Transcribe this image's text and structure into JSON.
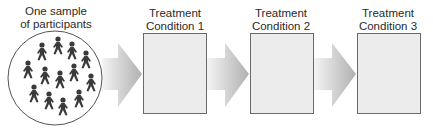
{
  "diagram": {
    "sample": {
      "label_line1": "One sample",
      "label_line2": "of participants",
      "participant_count": 16
    },
    "conditions": [
      {
        "line1": "Treatment",
        "line2": "Condition 1"
      },
      {
        "line1": "Treatment",
        "line2": "Condition 2"
      },
      {
        "line1": "Treatment",
        "line2": "Condition 3"
      }
    ],
    "colors": {
      "box_fill": "#ececec",
      "box_border": "#6a6a6a",
      "arrow_light": "#f2f2f2",
      "arrow_dark": "#b4b4b4",
      "figure": "#3a3a3a"
    }
  }
}
